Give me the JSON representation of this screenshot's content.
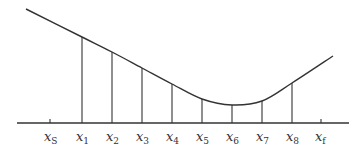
{
  "diagram": {
    "colors": {
      "line": "#333333",
      "background": "#ffffff"
    },
    "axis": {
      "y": 123,
      "x_start": 17,
      "x_end": 349
    },
    "curve": {
      "points": [
        [
          26,
          9
        ],
        [
          82,
          37
        ],
        [
          112,
          52
        ],
        [
          142,
          68
        ],
        [
          172,
          84
        ],
        [
          202,
          99
        ],
        [
          232,
          105
        ],
        [
          262,
          101
        ],
        [
          292,
          83
        ],
        [
          333,
          56
        ]
      ]
    },
    "ticks": [
      {
        "id": "xS",
        "base": "x",
        "sub": "S",
        "x": 50,
        "has_line": false,
        "top": 119
      },
      {
        "id": "x1",
        "base": "x",
        "sub": "1",
        "x": 82,
        "has_line": true,
        "top": 37
      },
      {
        "id": "x2",
        "base": "x",
        "sub": "2",
        "x": 112,
        "has_line": true,
        "top": 52
      },
      {
        "id": "x3",
        "base": "x",
        "sub": "3",
        "x": 142,
        "has_line": true,
        "top": 68
      },
      {
        "id": "x4",
        "base": "x",
        "sub": "4",
        "x": 172,
        "has_line": true,
        "top": 84
      },
      {
        "id": "x5",
        "base": "x",
        "sub": "5",
        "x": 202,
        "has_line": true,
        "top": 99
      },
      {
        "id": "x6",
        "base": "x",
        "sub": "6",
        "x": 232,
        "has_line": true,
        "top": 105
      },
      {
        "id": "x7",
        "base": "x",
        "sub": "7",
        "x": 262,
        "has_line": true,
        "top": 101
      },
      {
        "id": "x8",
        "base": "x",
        "sub": "8",
        "x": 292,
        "has_line": true,
        "top": 83
      },
      {
        "id": "xf",
        "base": "x",
        "sub": "f",
        "x": 321,
        "has_line": false,
        "top": 119
      }
    ]
  }
}
